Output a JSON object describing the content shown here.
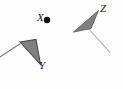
{
  "figure": {
    "width": 123,
    "height": 89,
    "background_color": "#fefefe",
    "labels": {
      "x": "X",
      "y": "Y",
      "z": "Z"
    },
    "colors": {
      "shape_fill": "#808080",
      "shape_stroke": "#4a4a4a",
      "tail_stroke": "#9a9a9a",
      "point_color": "#111111",
      "label_color": "#1a1a1a"
    },
    "point_x": {
      "name": "X",
      "cx": 47,
      "cy": 20,
      "r": 3.2
    },
    "shape_y": {
      "name": "Y",
      "polygon": "20,42 36,39.5 40.5,64.5",
      "tail": {
        "x1": 20.5,
        "y1": 43.5,
        "x2": 0,
        "y2": 57
      }
    },
    "shape_z": {
      "name": "Z",
      "polygon": "73.5,32 98.5,10.5 91,28.5",
      "tail": {
        "x1": 87,
        "y1": 27,
        "x2": 110,
        "y2": 52.5
      }
    }
  },
  "chart_data": {
    "type": "scatter",
    "title": "",
    "xlabel": "",
    "ylabel": "",
    "grid": false,
    "legend": null,
    "annotations": [
      "X",
      "Y",
      "Z"
    ],
    "points": [
      {
        "label": "X",
        "x": 47,
        "y": 20,
        "marker": "filled-dot"
      },
      {
        "label": "Y",
        "x": 40.5,
        "y": 64.5,
        "marker": "triangle-vertex"
      },
      {
        "label": "Z",
        "x": 98.5,
        "y": 10.5,
        "marker": "triangle-vertex"
      }
    ]
  }
}
